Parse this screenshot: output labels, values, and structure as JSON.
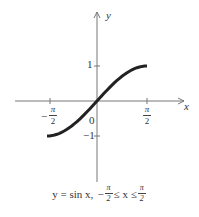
{
  "chart_data": {
    "type": "line",
    "xlabel": "x",
    "ylabel": "y",
    "x": [
      -1.5708,
      -1.1781,
      -0.7854,
      -0.3927,
      0,
      0.3927,
      0.7854,
      1.1781,
      1.5708
    ],
    "series": [
      {
        "name": "sin x",
        "values": [
          -1,
          -0.9239,
          -0.7071,
          -0.3827,
          0,
          0.3827,
          0.7071,
          0.9239,
          1
        ]
      }
    ],
    "x_ticks": [
      "-π/2",
      "π/2"
    ],
    "y_ticks": [
      "1",
      "-1"
    ],
    "origin_label": "0",
    "xlim": [
      -2.4,
      2.4
    ],
    "ylim": [
      -3,
      2.6
    ],
    "grid": false,
    "legend": "none"
  },
  "labels": {
    "x_axis": "x",
    "y_axis": "y",
    "origin": "0",
    "y_tick_pos": "1",
    "y_tick_neg": "−1",
    "x_tick_neg_sign": "−",
    "pi": "π",
    "two": "2"
  },
  "caption": {
    "lhs": "y = sin x,",
    "neg": "−",
    "pi": "π",
    "two": "2",
    "mid": "≤ x ≤"
  }
}
